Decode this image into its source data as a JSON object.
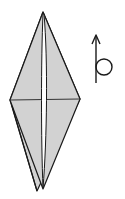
{
  "diagram": {
    "type": "origami-step",
    "colors": {
      "paper_fill": "#d2d2d2",
      "line": "#1a1a1a",
      "slit": "#ffffff",
      "background": "#ffffff"
    },
    "elements": [
      {
        "name": "folded-model",
        "shape": "elongated diamond",
        "apex_top": [
          43,
          12
        ],
        "left_point": [
          10,
          100
        ],
        "right_point": [
          80,
          99
        ],
        "bottom_tips": [
          [
            37,
            191
          ],
          [
            43,
            189
          ]
        ]
      },
      {
        "name": "center-slit",
        "orientation": "vertical"
      },
      {
        "name": "horizontal-crease",
        "orientation": "horizontal",
        "y": 100
      },
      {
        "name": "turn-over-symbol",
        "meaning": "rotate / turn over",
        "position": [
          96,
          35
        ]
      }
    ]
  }
}
